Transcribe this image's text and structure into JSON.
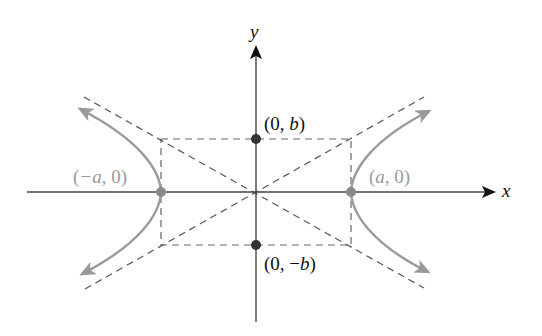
{
  "diagram": {
    "axes": {
      "x_label": "x",
      "y_label": "y"
    },
    "points": {
      "left_vertex": {
        "label": "(−a, 0)",
        "pre": "(",
        "var": "−a",
        "post": ", 0)"
      },
      "right_vertex": {
        "label": "(a, 0)",
        "pre": "(",
        "var": "a",
        "post": ", 0)"
      },
      "top_covertex": {
        "label": "(0, b)",
        "pre": "(0, ",
        "var": "b",
        "post": ")"
      },
      "bottom_covertex": {
        "label": "(0, −b)",
        "pre": "(0, −",
        "var": "b",
        "post": ")"
      }
    },
    "colors": {
      "axis": "#444444",
      "curve": "#999999",
      "asymptote": "#555555",
      "vertex_point": "#8a8a8a",
      "covertex_point": "#333333",
      "vertex_label": "#9a9a9a",
      "covertex_label": "#111111"
    }
  }
}
